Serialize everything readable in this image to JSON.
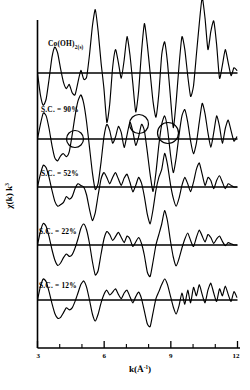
{
  "figure": {
    "name": "exafs-stacked-spectra",
    "background": "#ffffff",
    "line_color": "#000000"
  },
  "axes": {
    "x": {
      "label_main": "k(",
      "label_unit": "Å",
      "label_sup": "-1",
      "label_close": ")",
      "label_full": "k(Å⁻¹)",
      "ticks": [
        "3",
        "6",
        "9",
        "12"
      ],
      "tick_values": [
        3,
        6,
        9,
        12
      ],
      "minor_ticks": [
        4,
        5,
        7,
        8,
        10,
        11
      ],
      "range": [
        3,
        12
      ]
    },
    "y": {
      "label_chi": "χ(k) k",
      "label_exp": "3",
      "label_full": "χ(k) k³",
      "ticks": [],
      "grid": false
    }
  },
  "panels": [
    {
      "id": "p1",
      "label": "Co(OH)",
      "label_sub": "2(s)",
      "label_full": "Co(OH)2(s)",
      "has_sub": true
    },
    {
      "id": "p2",
      "label": "S.C. = 90%",
      "has_sub": false
    },
    {
      "id": "p3",
      "label": "S.C. = 52%",
      "has_sub": false
    },
    {
      "id": "p4",
      "label": "S.C. = 22%",
      "has_sub": false
    },
    {
      "id": "p5",
      "label": "S.C. = 12%",
      "has_sub": false
    }
  ],
  "annotations": {
    "circles": [
      {
        "name": "circle-feature-1",
        "cx": 75,
        "cy": 139,
        "r": 8.5
      },
      {
        "name": "circle-feature-2",
        "cx": 139,
        "cy": 124,
        "r": 9.5
      },
      {
        "name": "circle-feature-3",
        "cx": 168,
        "cy": 133,
        "r": 10.5
      }
    ]
  },
  "chart_data": {
    "type": "line",
    "title": "",
    "xlabel": "k(Å⁻¹)",
    "ylabel": "χ(k) k³",
    "xlim": [
      3,
      12
    ],
    "grid": false,
    "legend": "inline-panel-labels",
    "series": [
      {
        "name": "Co(OH)2(s)",
        "baseline_y": 73,
        "amplitude": 52,
        "x": [
          3.0,
          3.13,
          3.26,
          3.39,
          3.52,
          3.65,
          3.78,
          3.91,
          4.04,
          4.17,
          4.3,
          4.43,
          4.56,
          4.69,
          4.82,
          4.95,
          5.08,
          5.21,
          5.34,
          5.47,
          5.6,
          5.73,
          5.86,
          5.99,
          6.12,
          6.25,
          6.38,
          6.51,
          6.64,
          6.77,
          6.9,
          7.03,
          7.16,
          7.29,
          7.42,
          7.55,
          7.68,
          7.81,
          7.94,
          8.07,
          8.2,
          8.33,
          8.46,
          8.59,
          8.72,
          8.85,
          8.98,
          9.11,
          9.24,
          9.37,
          9.5,
          9.63,
          9.76,
          9.89,
          10.02,
          10.15,
          10.28,
          10.41,
          10.54,
          10.67,
          10.8,
          10.93,
          11.06,
          11.19,
          11.32,
          11.45,
          11.58,
          11.71,
          11.84,
          11.97
        ],
        "values": [
          0.0,
          -0.42,
          -0.62,
          -0.5,
          -0.12,
          0.3,
          0.5,
          0.38,
          0.08,
          -0.18,
          -0.3,
          -0.22,
          -0.38,
          -0.42,
          -0.18,
          0.05,
          -0.12,
          -0.08,
          0.35,
          0.9,
          1.22,
          0.8,
          0.2,
          -0.3,
          -0.95,
          -0.6,
          0.1,
          0.45,
          0.2,
          -0.1,
          0.25,
          0.7,
          0.35,
          -0.2,
          -0.75,
          -0.35,
          0.4,
          0.95,
          0.55,
          0.0,
          -0.55,
          -0.85,
          -0.4,
          0.35,
          0.6,
          0.2,
          -0.45,
          -1.05,
          -0.55,
          0.15,
          0.7,
          0.45,
          -0.05,
          -0.45,
          -0.25,
          0.35,
          0.95,
          1.45,
          1.05,
          0.45,
          0.8,
          1.0,
          0.55,
          -0.1,
          0.15,
          0.45,
          0.2,
          -0.05,
          0.1,
          0.05
        ]
      },
      {
        "name": "S.C. = 90%",
        "baseline_y": 139,
        "amplitude": 42,
        "x": [
          3.0,
          3.13,
          3.26,
          3.39,
          3.52,
          3.65,
          3.78,
          3.91,
          4.04,
          4.17,
          4.3,
          4.43,
          4.56,
          4.69,
          4.82,
          4.95,
          5.08,
          5.21,
          5.34,
          5.47,
          5.6,
          5.73,
          5.86,
          5.99,
          6.12,
          6.25,
          6.38,
          6.51,
          6.64,
          6.77,
          6.9,
          7.03,
          7.16,
          7.29,
          7.42,
          7.55,
          7.68,
          7.81,
          7.94,
          8.07,
          8.2,
          8.33,
          8.46,
          8.59,
          8.72,
          8.85,
          8.98,
          9.11,
          9.24,
          9.37,
          9.5,
          9.63,
          9.76,
          9.89,
          10.02,
          10.15,
          10.28,
          10.41,
          10.54,
          10.67,
          10.8,
          10.93,
          11.06,
          11.19,
          11.32,
          11.45,
          11.58,
          11.71,
          11.84,
          11.97
        ],
        "values": [
          0.0,
          0.35,
          0.62,
          0.55,
          0.25,
          -0.15,
          -0.45,
          -0.52,
          -0.4,
          -0.35,
          -0.42,
          -0.3,
          0.1,
          0.55,
          0.9,
          1.05,
          0.85,
          0.4,
          -0.2,
          -0.8,
          -1.2,
          -1.05,
          -0.55,
          0.05,
          0.35,
          0.2,
          -0.1,
          0.05,
          0.3,
          0.15,
          -0.2,
          0.1,
          0.4,
          0.18,
          -0.15,
          0.05,
          0.35,
          0.2,
          -0.3,
          -0.85,
          -1.25,
          -0.8,
          -0.15,
          0.35,
          0.55,
          0.25,
          -0.35,
          -0.8,
          -0.45,
          0.1,
          0.55,
          0.7,
          0.4,
          -0.05,
          -0.35,
          -0.1,
          0.4,
          0.85,
          0.6,
          0.15,
          -0.2,
          0.15,
          0.55,
          0.3,
          -0.1,
          0.25,
          0.45,
          0.2,
          -0.05,
          0.05
        ]
      },
      {
        "name": "S.C. = 52%",
        "baseline_y": 187,
        "amplitude": 32,
        "x": [
          3.0,
          3.13,
          3.26,
          3.39,
          3.52,
          3.65,
          3.78,
          3.91,
          4.04,
          4.17,
          4.3,
          4.43,
          4.56,
          4.69,
          4.82,
          4.95,
          5.08,
          5.21,
          5.34,
          5.47,
          5.6,
          5.73,
          5.86,
          5.99,
          6.12,
          6.25,
          6.38,
          6.51,
          6.64,
          6.77,
          6.9,
          7.03,
          7.16,
          7.29,
          7.42,
          7.55,
          7.68,
          7.81,
          7.94,
          8.07,
          8.2,
          8.33,
          8.46,
          8.59,
          8.72,
          8.85,
          8.98,
          9.11,
          9.24,
          9.37,
          9.5,
          9.63,
          9.76,
          9.89,
          10.02,
          10.15,
          10.28,
          10.41,
          10.54,
          10.67,
          10.8,
          10.93,
          11.06,
          11.19,
          11.32,
          11.45,
          11.58,
          11.71,
          11.84,
          11.97
        ],
        "values": [
          0.0,
          0.4,
          0.68,
          0.6,
          0.3,
          -0.1,
          -0.45,
          -0.6,
          -0.55,
          -0.48,
          -0.3,
          -0.38,
          -0.3,
          -0.05,
          0.1,
          0.05,
          0.0,
          -0.25,
          -0.7,
          -1.05,
          -0.8,
          -0.25,
          0.25,
          0.45,
          0.3,
          0.1,
          0.3,
          0.45,
          0.25,
          0.05,
          0.28,
          0.4,
          0.15,
          -0.15,
          0.05,
          0.3,
          0.12,
          -0.3,
          -0.85,
          -1.15,
          -0.7,
          -0.1,
          0.3,
          0.55,
          1.05,
          0.7,
          0.1,
          -0.35,
          -0.6,
          -0.35,
          0.05,
          0.3,
          0.1,
          -0.15,
          0.15,
          0.55,
          0.75,
          0.4,
          0.05,
          0.3,
          0.2,
          -0.05,
          0.2,
          0.35,
          0.15,
          -0.05,
          0.1,
          0.05,
          0.0,
          0.0
        ]
      },
      {
        "name": "S.C. = 22%",
        "baseline_y": 245,
        "amplitude": 30,
        "x": [
          3.0,
          3.13,
          3.26,
          3.39,
          3.52,
          3.65,
          3.78,
          3.91,
          4.04,
          4.17,
          4.3,
          4.43,
          4.56,
          4.69,
          4.82,
          4.95,
          5.08,
          5.21,
          5.34,
          5.47,
          5.6,
          5.73,
          5.86,
          5.99,
          6.12,
          6.25,
          6.38,
          6.51,
          6.64,
          6.77,
          6.9,
          7.03,
          7.16,
          7.29,
          7.42,
          7.55,
          7.68,
          7.81,
          7.94,
          8.07,
          8.2,
          8.33,
          8.46,
          8.59,
          8.72,
          8.85,
          8.98,
          9.11,
          9.24,
          9.37,
          9.5,
          9.63,
          9.76,
          9.89,
          10.02,
          10.15,
          10.28,
          10.41,
          10.54,
          10.67,
          10.8,
          10.93,
          11.06,
          11.19,
          11.32,
          11.45,
          11.58,
          11.71,
          11.84,
          11.97
        ],
        "values": [
          0.0,
          0.45,
          0.72,
          0.62,
          0.28,
          -0.15,
          -0.5,
          -0.68,
          -0.6,
          -0.42,
          -0.3,
          -0.38,
          -0.32,
          -0.1,
          0.2,
          0.55,
          0.7,
          0.5,
          0.05,
          -0.55,
          -1.0,
          -0.85,
          -0.3,
          0.2,
          0.45,
          0.35,
          0.15,
          0.28,
          0.42,
          0.25,
          0.08,
          0.3,
          0.2,
          -0.05,
          0.1,
          0.25,
          0.05,
          -0.35,
          -0.9,
          -1.05,
          -0.55,
          0.0,
          0.35,
          0.7,
          1.15,
          0.8,
          0.15,
          -0.4,
          -0.7,
          -0.45,
          -0.1,
          0.2,
          0.4,
          0.15,
          -0.05,
          0.25,
          0.5,
          0.3,
          0.1,
          0.35,
          0.25,
          0.05,
          0.2,
          0.3,
          0.12,
          -0.02,
          0.08,
          0.04,
          0.0,
          0.0
        ]
      },
      {
        "name": "S.C. = 12%",
        "baseline_y": 300,
        "amplitude": 28,
        "x": [
          3.0,
          3.13,
          3.26,
          3.39,
          3.52,
          3.65,
          3.78,
          3.91,
          4.04,
          4.17,
          4.3,
          4.43,
          4.56,
          4.69,
          4.82,
          4.95,
          5.08,
          5.21,
          5.34,
          5.47,
          5.6,
          5.73,
          5.86,
          5.99,
          6.12,
          6.25,
          6.38,
          6.51,
          6.64,
          6.77,
          6.9,
          7.03,
          7.16,
          7.29,
          7.42,
          7.55,
          7.68,
          7.81,
          7.94,
          8.07,
          8.2,
          8.33,
          8.46,
          8.59,
          8.72,
          8.85,
          8.98,
          9.11,
          9.24,
          9.37,
          9.5,
          9.63,
          9.76,
          9.89,
          10.02,
          10.15,
          10.28,
          10.41,
          10.54,
          10.67,
          10.8,
          10.93,
          11.06,
          11.19,
          11.32,
          11.45,
          11.58,
          11.71,
          11.84,
          11.97
        ],
        "values": [
          0.0,
          0.48,
          0.75,
          0.65,
          0.3,
          -0.12,
          -0.48,
          -0.65,
          -0.62,
          -0.45,
          -0.28,
          -0.35,
          -0.28,
          -0.05,
          0.25,
          0.55,
          0.68,
          0.45,
          0.0,
          -0.5,
          -0.75,
          -0.5,
          -0.1,
          0.2,
          0.35,
          0.18,
          0.28,
          0.4,
          0.2,
          0.05,
          0.25,
          0.35,
          0.12,
          -0.1,
          0.12,
          0.28,
          0.05,
          -0.4,
          -0.85,
          -0.95,
          -0.45,
          0.05,
          0.3,
          0.55,
          0.75,
          0.55,
          0.15,
          -0.25,
          -0.5,
          -0.2,
          0.25,
          -0.15,
          0.35,
          -0.1,
          0.45,
          0.15,
          0.55,
          0.2,
          -0.1,
          0.35,
          0.6,
          0.25,
          -0.05,
          0.4,
          0.15,
          0.5,
          0.2,
          -0.05,
          0.3,
          0.1
        ]
      }
    ]
  }
}
